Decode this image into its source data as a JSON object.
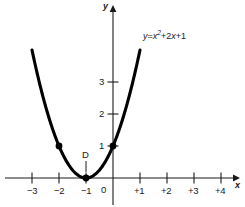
{
  "chart_data": {
    "type": "line",
    "title": "",
    "subtitle": "",
    "xlabel": "x",
    "ylabel": "y",
    "equation_label": "y = x² + 2x + 1",
    "equation_parts": {
      "lhs": "y",
      "eq": "=",
      "term1_base": "x",
      "term1_exp": "2",
      "term2": "+2",
      "term2_var": "x",
      "term3": "+1"
    },
    "grid": false,
    "legend": "none",
    "xlim": [
      -3.9,
      4.6
    ],
    "ylim": [
      -0.9,
      5.3
    ],
    "xticks": [
      -3,
      -2,
      -1,
      0,
      1,
      2,
      3,
      4
    ],
    "xtick_labels": [
      "−3",
      "−2",
      "−1",
      "0",
      "+1",
      "+2",
      "+3",
      "+4"
    ],
    "yticks": [
      1,
      2,
      3
    ],
    "ytick_labels": [
      "1",
      "2",
      "3"
    ],
    "series": [
      {
        "name": "y = x² + 2x + 1",
        "x": [
          -3.0,
          -2.8,
          -2.6,
          -2.4,
          -2.2,
          -2.0,
          -1.8,
          -1.6,
          -1.4,
          -1.2,
          -1.0,
          -0.8,
          -0.6,
          -0.4,
          -0.2,
          0.0,
          0.2,
          0.4,
          0.6,
          0.8,
          1.0
        ],
        "values": [
          4.0,
          3.24,
          2.56,
          1.96,
          1.44,
          1.0,
          0.64,
          0.36,
          0.16,
          0.04,
          0.0,
          0.04,
          0.16,
          0.36,
          0.64,
          1.0,
          1.44,
          1.96,
          2.56,
          3.24,
          4.0
        ]
      }
    ],
    "marked_points": [
      {
        "label": "",
        "x": -2,
        "y": 1
      },
      {
        "label": "D",
        "x": -1,
        "y": 0
      },
      {
        "label": "",
        "x": 0,
        "y": 1
      }
    ],
    "vertex": {
      "label": "D",
      "x": -1,
      "y": 0
    },
    "colors": {
      "curve": "#000000",
      "axis": "#1a1a1a",
      "text": "#1a1a1a",
      "background": "#ffffff",
      "marker": "#000000"
    }
  },
  "labels": {
    "x_axis_name": "x",
    "y_axis_name": "y",
    "vertex_name": "D",
    "tick_x_m3": "−3",
    "tick_x_m2": "−2",
    "tick_x_m1": "−1",
    "tick_x_0": "0",
    "tick_x_p1": "+1",
    "tick_x_p2": "+2",
    "tick_x_p3": "+3",
    "tick_x_p4": "+4",
    "tick_y_1": "1",
    "tick_y_2": "2",
    "tick_y_3": "3"
  }
}
